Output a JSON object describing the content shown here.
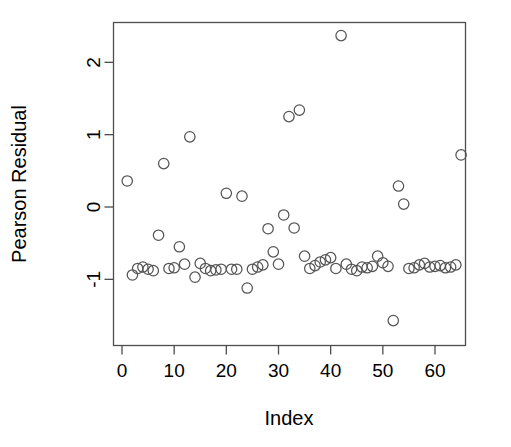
{
  "chart_data": {
    "type": "scatter",
    "title": "",
    "xlabel": "Index",
    "ylabel": "Pearson Residual",
    "xlim": [
      -1.5,
      67.5
    ],
    "ylim": [
      -1.78,
      2.62
    ],
    "grid": false,
    "legend": null,
    "marker": "open-circle",
    "marker_color": "#555555",
    "xticks": [
      0,
      10,
      20,
      30,
      40,
      50,
      60
    ],
    "xtick_labels": [
      "0",
      "10",
      "20",
      "30",
      "40",
      "50",
      "60"
    ],
    "yticks": [
      -1,
      0,
      1,
      2
    ],
    "ytick_labels": [
      "-1",
      "0",
      "1",
      "2"
    ],
    "x": [
      1,
      2,
      3,
      4,
      5,
      6,
      7,
      8,
      9,
      10,
      11,
      12,
      13,
      14,
      15,
      16,
      17,
      18,
      19,
      20,
      21,
      22,
      23,
      24,
      25,
      26,
      27,
      28,
      29,
      30,
      31,
      32,
      33,
      34,
      35,
      36,
      37,
      38,
      39,
      40,
      41,
      42,
      43,
      44,
      45,
      46,
      47,
      48,
      49,
      50,
      51,
      52,
      53,
      54,
      55,
      56,
      57,
      58,
      59,
      60,
      61,
      62,
      63,
      64,
      65
    ],
    "y": [
      0.36,
      -0.94,
      -0.85,
      -0.83,
      -0.86,
      -0.88,
      -0.39,
      0.6,
      -0.85,
      -0.84,
      -0.55,
      -0.79,
      0.97,
      -0.97,
      -0.78,
      -0.85,
      -0.88,
      -0.87,
      -0.86,
      0.19,
      -0.86,
      -0.86,
      0.15,
      -1.12,
      -0.86,
      -0.83,
      -0.8,
      -0.3,
      -0.62,
      -0.79,
      -0.11,
      1.25,
      -0.29,
      1.34,
      -0.68,
      -0.85,
      -0.81,
      -0.76,
      -0.73,
      -0.7,
      -0.85,
      2.37,
      -0.79,
      -0.86,
      -0.88,
      -0.83,
      -0.84,
      -0.82,
      -0.68,
      -0.77,
      -0.82,
      -1.57,
      0.29,
      0.04,
      -0.85,
      -0.84,
      -0.8,
      -0.78,
      -0.83,
      -0.82,
      -0.81,
      -0.84,
      -0.83,
      -0.8,
      0.72
    ],
    "point_count": 65
  },
  "axes": {
    "x_axis_name": "index-axis",
    "y_axis_name": "pearson-residual-axis"
  }
}
